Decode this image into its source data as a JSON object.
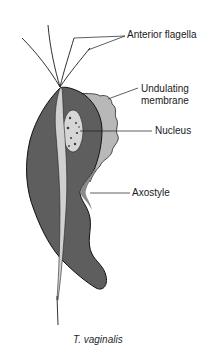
{
  "diagram": {
    "title": "T. vaginalis",
    "labels": {
      "anterior_flagella": "Anterior flagella",
      "undulating_membrane_line1": "Undulating",
      "undulating_membrane_line2": "membrane",
      "nucleus": "Nucleus",
      "axostyle": "Axostyle"
    },
    "colors": {
      "body": "#5e5e5e",
      "membrane": "#b8b8b8",
      "nucleus": "#d6d6d6",
      "axostyle": "#d0d0d0",
      "outline": "#111111"
    }
  }
}
